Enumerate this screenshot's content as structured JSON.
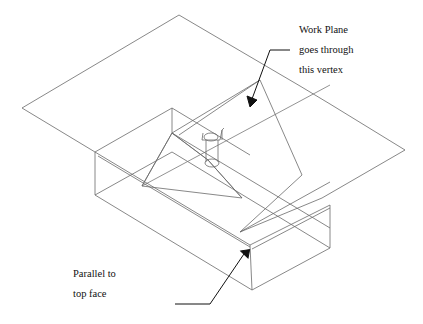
{
  "diagram": {
    "annotations": {
      "top": [
        "Work Plane",
        "goes through",
        "this vertex"
      ],
      "bottom": [
        "Parallel to",
        "top face"
      ]
    },
    "colors": {
      "line": "#6a6a6a",
      "arrow": "#111111",
      "background": "#ffffff"
    }
  }
}
